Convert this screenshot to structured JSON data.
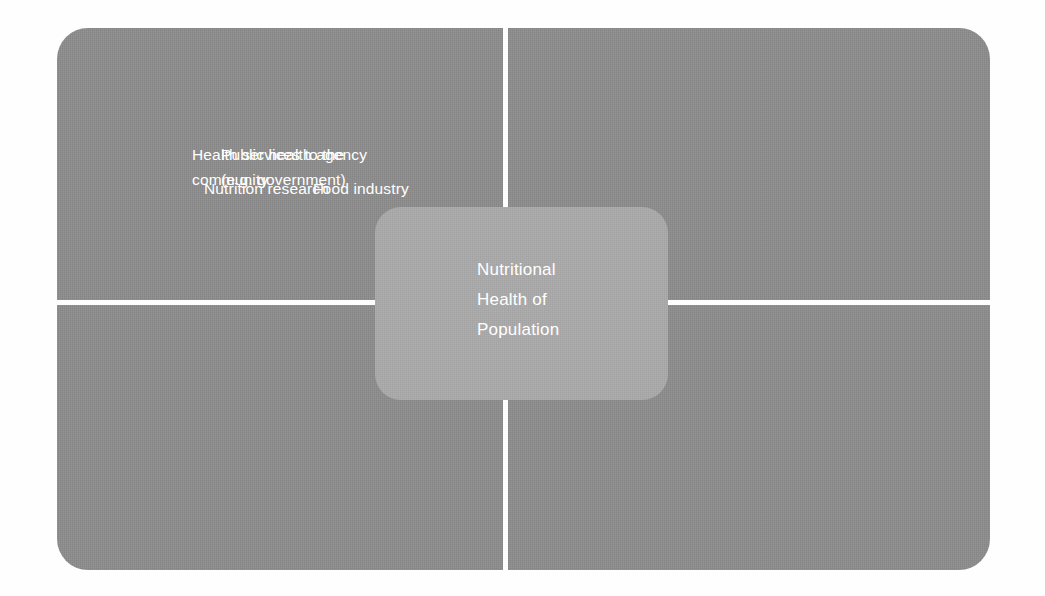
{
  "diagram": {
    "kind": "four-quadrant-hub-diagram",
    "background_color": "#fefefe",
    "plate_color": "#8c8c8c",
    "divider_color": "#fdfdfd",
    "center_color": "#a9a9a9",
    "text_color": "#ffffff",
    "center": {
      "label": "Nutritional\nHealth of\nPopulation"
    },
    "quadrants": [
      {
        "position": "top-left",
        "label": "Health services to the\ncommunity"
      },
      {
        "position": "top-right",
        "label": "Public health agency\n(e.g. government)"
      },
      {
        "position": "bottom-left",
        "label": "Nutrition research"
      },
      {
        "position": "bottom-right",
        "label": "Food industry"
      }
    ]
  }
}
